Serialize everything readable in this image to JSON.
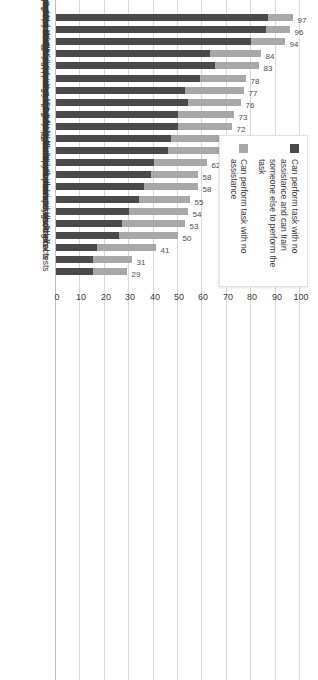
{
  "chart_data": {
    "type": "bar",
    "orientation": "vertical-rotated",
    "stacked": true,
    "title": "",
    "subtitle": "",
    "xlabel": "",
    "ylabel": "",
    "ylim": [
      0,
      100
    ],
    "ticks": [
      0,
      10,
      20,
      30,
      40,
      50,
      60,
      70,
      80,
      90,
      100
    ],
    "grid": true,
    "legend_position": "top-right",
    "categories": [
      "Risk assessments",
      "Triage walk-in patients",
      "Intake interviews",
      "Use BHDP",
      "Administer/score symptom measures",
      "Conduct behavioral health outreach",
      "Supportive counseling for mental health concerns",
      "Group counseling sessions",
      "Psychoeducational groups",
      "Monitor patient progress using symptom measures",
      "Review patient homework",
      "Conduct prevention/outreach",
      "Case management",
      "Administer/score psychological tests",
      "Supportive counseling for substance use",
      "Develop treatment plans",
      "Combat stress interventions",
      "Consult in non-behavioral health clinical settings",
      "Psychotherapy for mental health",
      "Psychotherapy for substance use disorders",
      "Assess medication adherence/side effects",
      "Administer/score neuropsychological tests"
    ],
    "series": [
      {
        "name": "Can perform task with no assistance and can train someone else to perform the task",
        "color": "#4a4a4a",
        "values": [
          87,
          86,
          80,
          63,
          65,
          59,
          53,
          54,
          50,
          50,
          47,
          46,
          40,
          39,
          36,
          36,
          30,
          27,
          26,
          17,
          15,
          15
        ]
      },
      {
        "name": "Can perform task with no assistance",
        "color": "#a8a8a8",
        "values": [
          10,
          10,
          14,
          21,
          18,
          19,
          24,
          22,
          23,
          22,
          24,
          21,
          22,
          19,
          22,
          22,
          24,
          26,
          24,
          24,
          16,
          14
        ]
      }
    ],
    "totals": [
      97,
      96,
      94,
      84,
      83,
      78,
      77,
      76,
      73,
      72,
      71,
      67,
      62,
      58,
      58,
      55,
      54,
      53,
      50,
      41,
      31,
      29
    ],
    "total_labels": [
      "97",
      "96",
      "94",
      "84",
      "83",
      "78",
      "77",
      "76",
      "73",
      "72",
      "71",
      "67",
      "62",
      "58",
      "58",
      "55",
      "54",
      "53",
      "50",
      "41",
      "31",
      "29"
    ]
  },
  "legend": {
    "entries": [
      {
        "label": "Can perform task with no assistance and can train someone else to perform the task",
        "color": "#4a4a4a"
      },
      {
        "label": "Can perform task with no assistance",
        "color": "#a8a8a8"
      }
    ]
  },
  "colors": {
    "dark_segment": "#4a4a4a",
    "light_segment": "#a8a8a8",
    "gridline": "#d9d9d9",
    "text": "#3a3a3a",
    "background": "#ffffff"
  }
}
